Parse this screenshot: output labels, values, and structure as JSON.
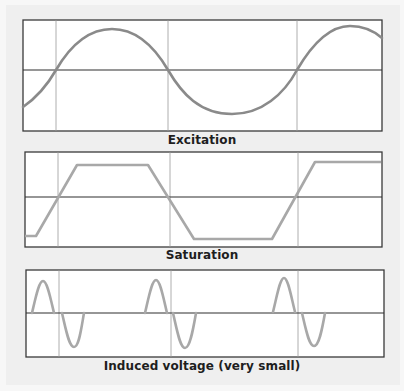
{
  "colors": {
    "background": "#efefef",
    "panel_fill": "#ffffff",
    "frame": "#3a3a3a",
    "gridline": "#9a9a9a",
    "axis": "#2e2e2e",
    "excitation_curve": "#8a8a8a",
    "saturation_curve": "#a8a8a8",
    "induced_curve": "#a8a8a8"
  },
  "panels": [
    {
      "id": "excitation",
      "label": "Excitation",
      "frame": {
        "x": 23,
        "y": 20,
        "w": 359,
        "h": 111
      },
      "baseline_y": 70,
      "gridlines_x": [
        56,
        168,
        297
      ],
      "curve": "sine"
    },
    {
      "id": "saturation",
      "label": "Saturation",
      "frame": {
        "x": 25,
        "y": 152,
        "w": 357,
        "h": 95
      },
      "baseline_y": 197,
      "gridlines_x": [
        58,
        170,
        298
      ],
      "curve": "clipped-trapezoid"
    },
    {
      "id": "induced",
      "label": "Induced voltage (very small)",
      "frame": {
        "x": 26,
        "y": 270,
        "w": 358,
        "h": 87
      },
      "baseline_y": 312,
      "gridlines_x": [
        59,
        171,
        298
      ],
      "curve": "pulses-at-transitions"
    }
  ]
}
